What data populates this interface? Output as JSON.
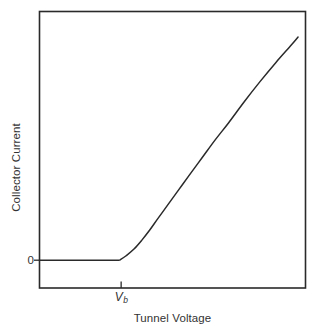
{
  "chart_data": {
    "type": "line",
    "title": "",
    "xlabel": "Tunnel Voltage",
    "ylabel": "Collector Current",
    "xtick_labels": [
      "V_b"
    ],
    "ytick_labels": [
      "0"
    ],
    "x_tick_values": [
      0.311
    ],
    "y_tick_values": [
      0.0
    ],
    "grid": false,
    "legend": null,
    "xlim": [
      0,
      1
    ],
    "ylim": [
      0,
      1
    ],
    "axis_frame": "full-box",
    "series": [
      {
        "name": "Collector current vs tunnel voltage",
        "description": "Flat at zero until the barrier voltage V_b, then rises with increasing slope before becoming nearly linear.",
        "x": [
          0.0,
          0.05,
          0.1,
          0.15,
          0.2,
          0.25,
          0.3,
          0.311,
          0.33,
          0.36,
          0.39,
          0.42,
          0.45,
          0.49,
          0.53,
          0.57,
          0.62,
          0.67,
          0.72,
          0.78,
          0.84,
          0.9,
          0.96,
          0.985
        ],
        "y": [
          0.0,
          0.0,
          0.0,
          0.0,
          0.0,
          0.0,
          0.0,
          0.005,
          0.02,
          0.05,
          0.09,
          0.135,
          0.185,
          0.25,
          0.315,
          0.38,
          0.46,
          0.54,
          0.615,
          0.71,
          0.8,
          0.885,
          0.965,
          1.0
        ]
      }
    ]
  },
  "labels": {
    "y_axis_title": "Collector Current",
    "x_axis_title": "Tunnel Voltage",
    "y_zero_tick": "0",
    "x_vb_tick_v": "V",
    "x_vb_tick_sub": "b"
  },
  "colors": {
    "line": "#2a2a2a",
    "axis": "#2a2a2a",
    "text": "#333333",
    "background": "#ffffff"
  }
}
